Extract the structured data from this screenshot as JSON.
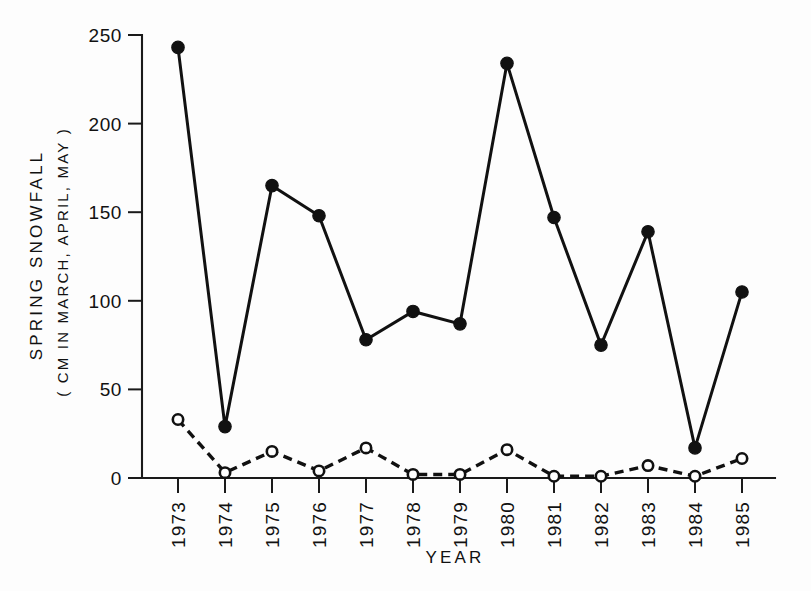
{
  "chart_data": {
    "type": "line",
    "title": "",
    "xlabel": "YEAR",
    "ylabel": "SPRING SNOWFALL",
    "ylabel_sub": "( CM IN MARCH, APRIL, MAY )",
    "categories": [
      "1973",
      "1974",
      "1975",
      "1976",
      "1977",
      "1978",
      "1979",
      "1980",
      "1981",
      "1982",
      "1983",
      "1984",
      "1985"
    ],
    "x": [
      1973,
      1974,
      1975,
      1976,
      1977,
      1978,
      1979,
      1980,
      1981,
      1982,
      1983,
      1984,
      1985
    ],
    "xlim": [
      1972.5,
      1985.5
    ],
    "ylim": [
      0,
      250
    ],
    "yticks": [
      0,
      50,
      100,
      150,
      200,
      250
    ],
    "ytick_labels": [
      "0",
      "50",
      "100",
      "150",
      "200",
      "250"
    ],
    "xtick_labels": [
      "1973",
      "1974",
      "1975",
      "1976",
      "1977",
      "1978",
      "1979",
      "1980",
      "1981",
      "1982",
      "1983",
      "1984",
      "1985"
    ],
    "grid": false,
    "legend": "none",
    "series": [
      {
        "name": "total-spring-snowfall",
        "style": "solid",
        "marker": "filled-circle",
        "color": "#111111",
        "values": [
          243,
          29,
          165,
          148,
          78,
          94,
          87,
          234,
          147,
          75,
          139,
          17,
          105
        ]
      },
      {
        "name": "secondary-spring-snowfall",
        "style": "dashed",
        "marker": "open-circle",
        "color": "#111111",
        "values": [
          33,
          3,
          15,
          4,
          17,
          2,
          2,
          16,
          1,
          1,
          7,
          1,
          11
        ]
      }
    ]
  },
  "axes": {
    "y_title": "SPRING SNOWFALL",
    "y_subtitle": "( CM IN MARCH, APRIL, MAY )",
    "x_title": "YEAR"
  }
}
